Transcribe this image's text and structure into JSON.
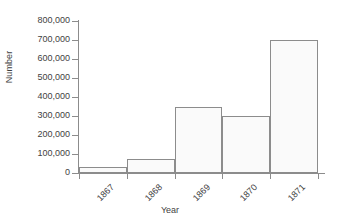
{
  "chart_data": {
    "type": "bar",
    "title": "",
    "xlabel": "Year",
    "ylabel": "Number",
    "categories": [
      "1867",
      "1868",
      "1869",
      "1870",
      "1871"
    ],
    "values": [
      30000,
      75000,
      350000,
      300000,
      700000
    ],
    "ylim": [
      0,
      800000
    ],
    "yticks": [
      0,
      100000,
      200000,
      300000,
      400000,
      500000,
      600000,
      700000,
      800000
    ],
    "ytick_labels": [
      "0",
      "100,000",
      "200,000",
      "300,000",
      "400,000",
      "500,000",
      "600,000",
      "700,000",
      "800,000"
    ],
    "grid": false,
    "legend": null,
    "bar_style": {
      "fill": "#fafafa",
      "edge": "#8c8c8c",
      "contiguous": true
    },
    "axis_color": "#8c8c8c",
    "text_color": "#3f3f3f",
    "background": "#ffffff"
  }
}
